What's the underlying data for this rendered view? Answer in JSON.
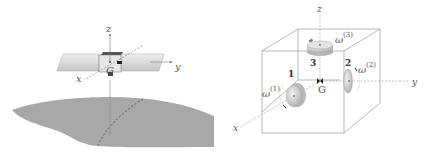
{
  "left_figure": {
    "axes": {
      "x": "x",
      "y": "y",
      "z": "z"
    },
    "center_label": "G",
    "colors": {
      "panel": "#d9d9d9",
      "earth": "#a8a8a8",
      "axis": "#777777"
    }
  },
  "right_figure": {
    "axes": {
      "x": "x",
      "y": "y",
      "z": "z"
    },
    "center_label": "G",
    "wheels": [
      {
        "number": "1",
        "omega": "ω",
        "superscript": "(1)"
      },
      {
        "number": "2",
        "omega": "ω",
        "superscript": "(2)"
      },
      {
        "number": "3",
        "omega": "ω",
        "superscript": "(3)"
      }
    ],
    "colors": {
      "cube": "#888888",
      "wheel": "#d0d0d0"
    }
  }
}
